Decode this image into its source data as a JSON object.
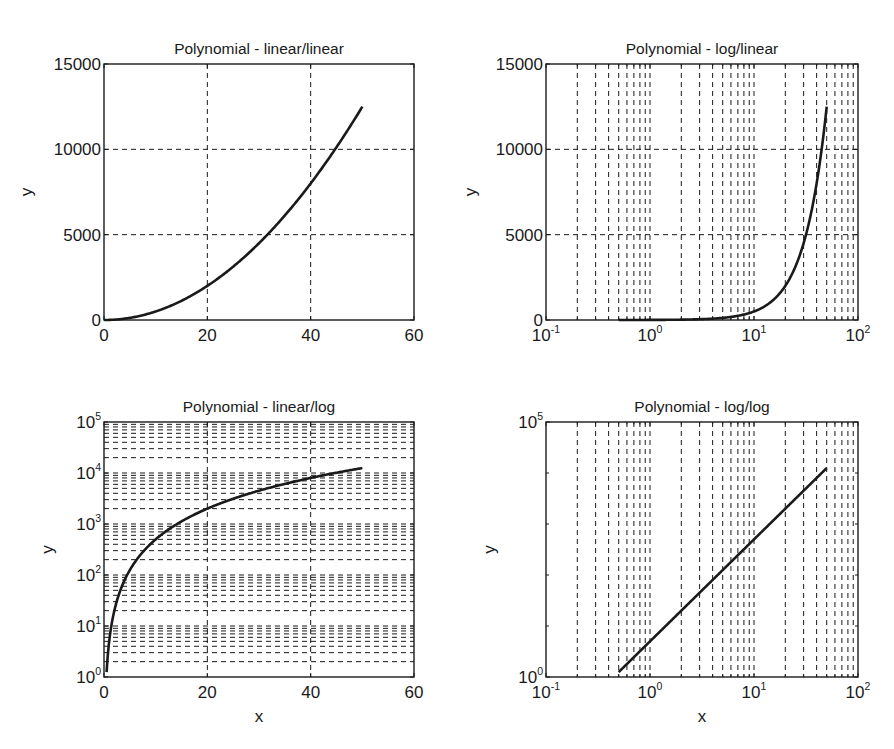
{
  "figure": {
    "width": 894,
    "height": 749,
    "background": "#ffffff",
    "line_color": "#1a1a1a",
    "grid_color": "#1a1a1a"
  },
  "chart_data": [
    {
      "id": "linear-linear",
      "type": "line",
      "title": "Polynomial - linear/linear",
      "xlabel": "",
      "ylabel": "y",
      "xscale": "linear",
      "yscale": "linear",
      "xlim": [
        0,
        60
      ],
      "ylim": [
        0,
        15000
      ],
      "xticks": [
        0,
        20,
        40,
        60
      ],
      "xtick_labels": [
        "0",
        "20",
        "40",
        "60"
      ],
      "yticks": [
        0,
        5000,
        10000,
        15000
      ],
      "ytick_labels": [
        "0",
        "5000",
        "10000",
        "15000"
      ],
      "grid": "major",
      "box": {
        "left": 104,
        "top": 64,
        "right": 414,
        "bottom": 320
      },
      "series": [
        {
          "name": "y = 5x^2",
          "function": "5*x^2",
          "x_range": [
            0,
            50
          ],
          "x": [
            0,
            5,
            10,
            15,
            20,
            25,
            30,
            35,
            40,
            45,
            50
          ],
          "y": [
            0,
            125,
            500,
            1125,
            2000,
            3125,
            4500,
            6125,
            8000,
            10125,
            12500
          ]
        }
      ]
    },
    {
      "id": "log-linear",
      "type": "line",
      "title": "Polynomial - log/linear",
      "xlabel": "",
      "ylabel": "y",
      "xscale": "log",
      "yscale": "linear",
      "xlim": [
        0.1,
        100
      ],
      "ylim": [
        0,
        15000
      ],
      "xticks": [
        0.1,
        1,
        10,
        100
      ],
      "xtick_labels": [
        {
          "base": "10",
          "exp": "-1"
        },
        {
          "base": "10",
          "exp": "0"
        },
        {
          "base": "10",
          "exp": "1"
        },
        {
          "base": "10",
          "exp": "2"
        }
      ],
      "yticks": [
        0,
        5000,
        10000,
        15000
      ],
      "ytick_labels": [
        "0",
        "5000",
        "10000",
        "15000"
      ],
      "grid": "x-major-minor, y-major",
      "box": {
        "left": 546,
        "top": 64,
        "right": 858,
        "bottom": 320
      },
      "series": [
        {
          "name": "y = 5x^2",
          "function": "5*x^2",
          "x_range": [
            0.5,
            50
          ],
          "x": [
            0.5,
            1,
            2,
            5,
            10,
            20,
            30,
            40,
            50
          ],
          "y": [
            1.25,
            5,
            20,
            125,
            500,
            2000,
            4500,
            8000,
            12500
          ]
        }
      ]
    },
    {
      "id": "linear-log",
      "type": "line",
      "title": "Polynomial - linear/log",
      "xlabel": "x",
      "ylabel": "y",
      "xscale": "linear",
      "yscale": "log",
      "xlim": [
        0,
        60
      ],
      "ylim": [
        1,
        100000
      ],
      "xticks": [
        0,
        20,
        40,
        60
      ],
      "xtick_labels": [
        "0",
        "20",
        "40",
        "60"
      ],
      "yticks": [
        1,
        10,
        100,
        1000,
        10000,
        100000
      ],
      "ytick_labels": [
        {
          "base": "10",
          "exp": "0"
        },
        {
          "base": "10",
          "exp": "1"
        },
        {
          "base": "10",
          "exp": "2"
        },
        {
          "base": "10",
          "exp": "3"
        },
        {
          "base": "10",
          "exp": "4"
        },
        {
          "base": "10",
          "exp": "5"
        }
      ],
      "grid": "x-major, y-major-minor",
      "box": {
        "left": 104,
        "top": 422,
        "right": 414,
        "bottom": 677
      },
      "series": [
        {
          "name": "y = 5x^2",
          "function": "5*x^2",
          "x_range": [
            0.5,
            50
          ],
          "x": [
            0.5,
            1,
            2,
            5,
            10,
            20,
            30,
            40,
            50
          ],
          "y": [
            1.25,
            5,
            20,
            125,
            500,
            2000,
            4500,
            8000,
            12500
          ]
        }
      ]
    },
    {
      "id": "log-log",
      "type": "line",
      "title": "Polynomial - log/log",
      "xlabel": "x",
      "ylabel": "y",
      "xscale": "log",
      "yscale": "log",
      "xlim": [
        0.1,
        100
      ],
      "ylim": [
        1,
        100000
      ],
      "xticks": [
        0.1,
        1,
        10,
        100
      ],
      "xtick_labels": [
        {
          "base": "10",
          "exp": "-1"
        },
        {
          "base": "10",
          "exp": "0"
        },
        {
          "base": "10",
          "exp": "1"
        },
        {
          "base": "10",
          "exp": "2"
        }
      ],
      "yticks": [
        1,
        100000
      ],
      "ytick_labels": [
        {
          "base": "10",
          "exp": "0"
        },
        {
          "base": "10",
          "exp": "5"
        }
      ],
      "yminor_ticks": [
        10,
        100,
        1000,
        10000
      ],
      "grid": "x-major-minor",
      "box": {
        "left": 546,
        "top": 422,
        "right": 858,
        "bottom": 677
      },
      "series": [
        {
          "name": "y = 5x^2",
          "function": "5*x^2",
          "x_range": [
            0.5,
            50
          ],
          "x": [
            0.5,
            1,
            2,
            5,
            10,
            20,
            50
          ],
          "y": [
            1.25,
            5,
            20,
            125,
            500,
            2000,
            12500
          ]
        }
      ]
    }
  ]
}
